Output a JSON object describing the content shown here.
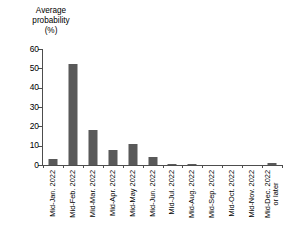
{
  "chart_data": {
    "type": "bar",
    "title": "",
    "title_lines": [
      "Average",
      "probability",
      "(%)"
    ],
    "xlabel": "",
    "ylabel": "Average probability (%)",
    "ylim": [
      0,
      60
    ],
    "yticks": [
      0,
      10,
      20,
      30,
      40,
      50,
      60
    ],
    "ytick_labels": [
      "0",
      "10",
      "20",
      "30",
      "40",
      "50",
      "60"
    ],
    "grid": false,
    "legend": "none",
    "bar_color": "#595959",
    "axis_color": "#4d4d4d",
    "categories": [
      "Mid-Jan. 2022",
      "Mid-Feb. 2022",
      "Mid-Mar. 2022",
      "Mid-Apr. 2022",
      "Mid-May 2022",
      "Mid-Jun. 2022",
      "Mid-Jul. 2022",
      "Mid-Aug. 2022",
      "Mid-Sep. 2022",
      "Mid-Oct. 2022",
      "Mid-Nov. 2022",
      "Mid-Dec. 2022"
    ],
    "category_sublabels": [
      "",
      "",
      "",
      "",
      "",
      "",
      "",
      "",
      "",
      "",
      "",
      "or later"
    ],
    "values": [
      3,
      52,
      18,
      8,
      11,
      4,
      0.7,
      0.6,
      0,
      0,
      0,
      1.2
    ]
  }
}
